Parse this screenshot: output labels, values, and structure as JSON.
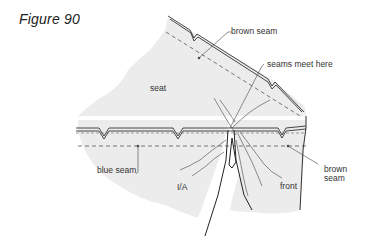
{
  "figure": {
    "title": "Figure 90"
  },
  "labels": {
    "brown_seam_top": "brown seam",
    "seams_meet_here": "seams meet here",
    "seat": "seat",
    "blue_seam": "blue seam",
    "ia": "I/A",
    "front": "front",
    "brown_seam_right_line1": "brown",
    "brown_seam_right_line2": "seam"
  },
  "colors": {
    "fabric_fill": "#ececec",
    "line": "#333333",
    "background": "#ffffff"
  }
}
